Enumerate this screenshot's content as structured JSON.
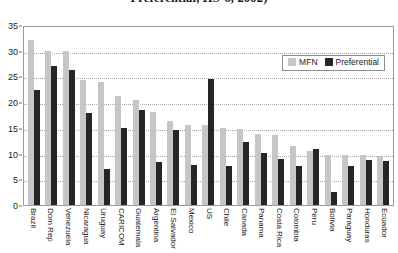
{
  "title": "Preferential, HS-6, 2002)",
  "legend": {
    "position": "top-right-inside",
    "mfn_label": "MFN",
    "preferential_label": "Preferential",
    "mfn_color": "#c6c6c6",
    "preferential_color": "#262626"
  },
  "axis": {
    "y_ticks": [
      "0",
      "5",
      "10",
      "15",
      "20",
      "25",
      "30",
      "35"
    ]
  },
  "chart_data": {
    "type": "bar",
    "title": "Preferential, HS-6, 2002)",
    "xlabel": "",
    "ylabel": "",
    "ylim": [
      0,
      35
    ],
    "ytick_step": 5,
    "grid": true,
    "legend_position": "upper right",
    "categories": [
      "Brazil",
      "Dom Rep",
      "Venezuela",
      "Nicaragua",
      "Uruguay",
      "CARICOM",
      "Guatemala",
      "Argentina",
      "El Salvador",
      "Mexico",
      "US",
      "Chile",
      "Canada",
      "Panama",
      "Costa Rica",
      "Colombia",
      "Peru",
      "Bolivia",
      "Paraguay",
      "Honduras",
      "Ecuador"
    ],
    "series": [
      {
        "name": "MFN",
        "color": "#c6c6c6",
        "values": [
          32.0,
          30.0,
          30.0,
          24.3,
          24.0,
          21.2,
          20.5,
          18.0,
          16.3,
          15.6,
          15.5,
          15.0,
          14.8,
          13.8,
          13.6,
          11.5,
          10.6,
          9.8,
          9.8,
          9.7,
          9.6
        ]
      },
      {
        "name": "Preferential",
        "color": "#262626",
        "values": [
          22.3,
          27.0,
          26.3,
          17.8,
          7.0,
          15.0,
          18.5,
          8.3,
          14.5,
          7.8,
          24.5,
          7.5,
          12.3,
          10.2,
          9.0,
          7.5,
          10.8,
          2.5,
          7.5,
          8.7,
          8.6
        ]
      }
    ]
  }
}
